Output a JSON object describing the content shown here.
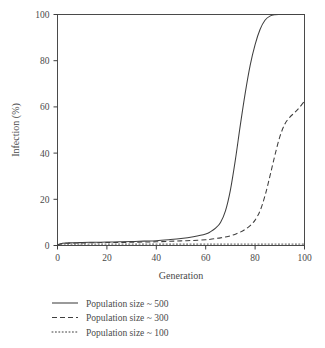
{
  "figure": {
    "name": "infection-vs-generation-line-chart",
    "background": "#ffffff",
    "foreground": "#4a4a4a"
  },
  "chart_data": {
    "type": "line",
    "title": "",
    "xlabel": "Generation",
    "ylabel": "Infection (%)",
    "xlim": [
      0,
      100
    ],
    "ylim": [
      0,
      100
    ],
    "xticks": [
      0,
      20,
      40,
      60,
      80,
      100
    ],
    "yticks": [
      0,
      20,
      40,
      60,
      80,
      100
    ],
    "grid": false,
    "legend_position": "below-axes",
    "x": [
      0,
      2,
      4,
      6,
      8,
      10,
      15,
      20,
      25,
      30,
      35,
      40,
      45,
      50,
      55,
      60,
      62,
      64,
      66,
      68,
      70,
      72,
      74,
      76,
      78,
      80,
      82,
      84,
      86,
      88,
      90,
      92,
      94,
      96,
      98,
      100
    ],
    "series": [
      {
        "name": "Population size ~ 500",
        "key": "pop500",
        "style": "solid",
        "color": "#3f3f3f",
        "values": [
          0.3,
          1.0,
          1.1,
          1.2,
          1.2,
          1.3,
          1.4,
          1.5,
          1.6,
          1.7,
          1.9,
          2.1,
          2.5,
          3.0,
          3.8,
          5.0,
          6.0,
          7.5,
          10.0,
          15.0,
          24.0,
          37.0,
          52.0,
          66.0,
          78.0,
          87.0,
          93.5,
          97.5,
          99.3,
          99.9,
          100.0,
          100.0,
          100.0,
          100.0,
          100.0,
          100.0
        ]
      },
      {
        "name": "Population size ~ 300",
        "key": "pop300",
        "style": "dashed",
        "color": "#3f3f3f",
        "values": [
          0.3,
          0.9,
          1.0,
          1.0,
          1.1,
          1.1,
          1.2,
          1.3,
          1.3,
          1.4,
          1.5,
          1.6,
          1.8,
          2.0,
          2.2,
          2.5,
          2.7,
          3.0,
          3.3,
          3.7,
          4.2,
          4.9,
          5.8,
          7.0,
          8.6,
          11.0,
          15.0,
          21.5,
          30.0,
          39.0,
          47.0,
          52.5,
          55.5,
          57.5,
          59.8,
          62.5
        ]
      },
      {
        "name": "Population size ~ 100",
        "key": "pop100",
        "style": "dotted",
        "color": "#3f3f3f",
        "values": [
          0.2,
          0.6,
          0.6,
          0.6,
          0.6,
          0.6,
          0.6,
          0.6,
          0.6,
          0.6,
          0.6,
          0.6,
          0.6,
          0.6,
          0.6,
          0.6,
          0.6,
          0.6,
          0.6,
          0.6,
          0.6,
          0.6,
          0.6,
          0.6,
          0.6,
          0.6,
          0.6,
          0.6,
          0.6,
          0.6,
          0.6,
          0.6,
          0.6,
          0.6,
          0.6,
          0.6
        ]
      }
    ],
    "legend": [
      {
        "label": "Population size ~ 500",
        "style": "solid"
      },
      {
        "label": "Population size ~ 300",
        "style": "dashed"
      },
      {
        "label": "Population size ~ 100",
        "style": "dotted"
      }
    ]
  }
}
